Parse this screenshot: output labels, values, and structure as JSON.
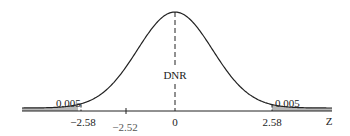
{
  "chart_data": {
    "type": "area",
    "title": "",
    "xlabel": "Z",
    "ylabel": "",
    "xlim": [
      -3.5,
      3.5
    ],
    "region_label": "DNR",
    "tails": [
      {
        "side": "left",
        "critical_value": -2.58,
        "area": "0.005"
      },
      {
        "side": "right",
        "critical_value": 2.58,
        "area": "0.005"
      }
    ],
    "tick_labels": [
      "-2.58",
      "-2.52",
      "0",
      "2.58"
    ],
    "test_statistic": -2.52,
    "grid": false
  },
  "labels": {
    "left_area": "0.005",
    "right_area": "0.005",
    "dnr": "DNR",
    "tick_neg258": "−2.58",
    "tick_neg252": "−2.52",
    "tick_zero": "0",
    "tick_pos258": "2.58",
    "axis_z": "Z"
  },
  "colors": {
    "shade": "#b8b8b8",
    "line": "#222222"
  }
}
